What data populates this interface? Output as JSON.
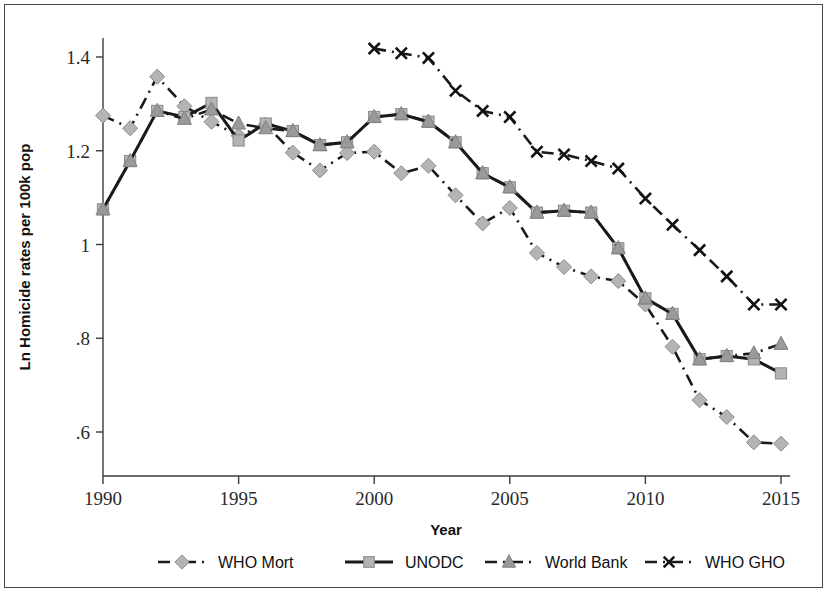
{
  "figure": {
    "y_axis_title": "Ln Homicide rates per 100k pop",
    "x_axis_title": "Year"
  },
  "axes": {
    "y_ticks": [
      "1.4",
      "1.2",
      "1",
      ".8",
      ".6"
    ],
    "x_ticks": [
      "1990",
      "1995",
      "2000",
      "2005",
      "2010",
      "2015"
    ]
  },
  "legend": {
    "items": [
      {
        "label": "WHO Mort",
        "marker": "diamond",
        "dash": "dash-dot"
      },
      {
        "label": "UNODC",
        "marker": "square",
        "dash": "solid"
      },
      {
        "label": "World Bank",
        "marker": "triangle",
        "dash": "dash-dot"
      },
      {
        "label": "WHO GHO",
        "marker": "cross",
        "dash": "dash-dot"
      }
    ]
  },
  "colors": {
    "line": "#1a1a1a",
    "marker_light": "#b4b4b4",
    "marker_mid": "#9a9a9a",
    "frame": "#4a4a4a",
    "background": "#ffffff"
  },
  "chart_data": {
    "type": "line",
    "title": "",
    "xlabel": "Year",
    "ylabel": "Ln Homicide rates per 100k pop",
    "xlim": [
      1990,
      2015
    ],
    "ylim": [
      0.54,
      1.45
    ],
    "grid": false,
    "legend_position": "bottom",
    "x": [
      1990,
      1991,
      1992,
      1993,
      1994,
      1995,
      1996,
      1997,
      1998,
      1999,
      2000,
      2001,
      2002,
      2003,
      2004,
      2005,
      2006,
      2007,
      2008,
      2009,
      2010,
      2011,
      2012,
      2013,
      2014,
      2015
    ],
    "series": [
      {
        "name": "WHO Mort",
        "marker": "diamond",
        "dash": "dash-dot",
        "x": [
          1990,
          1991,
          1992,
          1993,
          1994,
          1995,
          1996,
          1997,
          1998,
          1999,
          2000,
          2001,
          2002,
          2003,
          2004,
          2005,
          2006,
          2007,
          2008,
          2009,
          2010,
          2011,
          2012,
          2013,
          2014,
          2015
        ],
        "values": [
          1.275,
          1.248,
          1.358,
          1.295,
          1.262,
          1.232,
          1.256,
          1.196,
          1.158,
          1.195,
          1.198,
          1.152,
          1.168,
          1.105,
          1.045,
          1.078,
          0.982,
          0.952,
          0.932,
          0.922,
          0.872,
          0.782,
          0.668,
          0.632,
          0.578,
          0.575
        ]
      },
      {
        "name": "UNODC",
        "marker": "square",
        "dash": "solid",
        "x": [
          1990,
          1991,
          1992,
          1993,
          1994,
          1995,
          1996,
          1997,
          1998,
          1999,
          2000,
          2001,
          2002,
          2003,
          2004,
          2005,
          2006,
          2007,
          2008,
          2009,
          2010,
          2011,
          2012,
          2013,
          2014,
          2015
        ],
        "values": [
          1.075,
          1.178,
          1.285,
          1.272,
          1.302,
          1.222,
          1.258,
          1.242,
          1.212,
          1.218,
          1.272,
          1.278,
          1.262,
          1.218,
          1.152,
          1.122,
          1.068,
          1.072,
          1.068,
          0.992,
          0.885,
          0.852,
          0.755,
          0.762,
          0.755,
          0.725
        ]
      },
      {
        "name": "World Bank",
        "marker": "triangle",
        "dash": "dash-dot",
        "x": [
          1990,
          1991,
          1992,
          1993,
          1994,
          1995,
          1996,
          1997,
          1998,
          1999,
          2000,
          2001,
          2002,
          2003,
          2004,
          2005,
          2006,
          2007,
          2008,
          2009,
          2010,
          2011,
          2012,
          2013,
          2014,
          2015
        ],
        "values": [
          1.075,
          1.178,
          1.285,
          1.268,
          1.288,
          1.258,
          1.248,
          1.242,
          1.212,
          1.218,
          1.272,
          1.278,
          1.262,
          1.218,
          1.152,
          1.122,
          1.068,
          1.072,
          1.068,
          0.992,
          0.885,
          0.852,
          0.755,
          0.762,
          0.768,
          0.788
        ]
      },
      {
        "name": "WHO GHO",
        "marker": "cross",
        "dash": "dash-dot",
        "x": [
          2000,
          2001,
          2002,
          2003,
          2004,
          2005,
          2006,
          2007,
          2008,
          2009,
          2010,
          2011,
          2012,
          2013,
          2014,
          2015
        ],
        "values": [
          1.418,
          1.408,
          1.398,
          1.328,
          1.285,
          1.272,
          1.198,
          1.192,
          1.178,
          1.162,
          1.098,
          1.042,
          0.988,
          0.932,
          0.872,
          0.872
        ]
      }
    ]
  }
}
